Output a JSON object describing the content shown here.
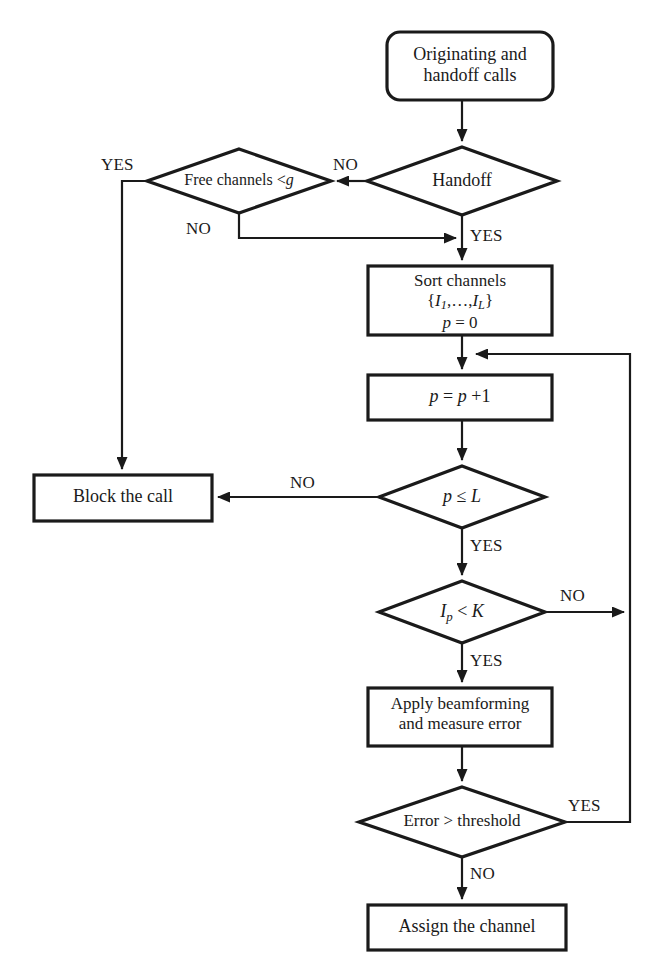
{
  "diagram": {
    "stroke_color": "#1a1a1a",
    "fill_color": "#ffffff",
    "nodes": [
      {
        "id": "start",
        "shape": "rounded-rect",
        "lines": [
          "Originating and",
          "handoff calls"
        ]
      },
      {
        "id": "handoff",
        "shape": "diamond",
        "lines": [
          "Handoff"
        ]
      },
      {
        "id": "freechan",
        "shape": "diamond",
        "lines": [
          "Free channels <g"
        ]
      },
      {
        "id": "sort",
        "shape": "rect",
        "lines": [
          "Sort channels",
          "{I1,…,IL}",
          "p = 0"
        ]
      },
      {
        "id": "increment",
        "shape": "rect",
        "lines": [
          "p = p +1"
        ]
      },
      {
        "id": "block",
        "shape": "rect",
        "lines": [
          "Block the call"
        ]
      },
      {
        "id": "ple",
        "shape": "diamond",
        "lines": [
          "p ≤ L"
        ]
      },
      {
        "id": "ipk",
        "shape": "diamond",
        "lines": [
          "Ip < K"
        ]
      },
      {
        "id": "beamform",
        "shape": "rect",
        "lines": [
          "Apply beamforming",
          "and measure error"
        ]
      },
      {
        "id": "errthresh",
        "shape": "diamond",
        "lines": [
          "Error > threshold"
        ]
      },
      {
        "id": "assign",
        "shape": "rect",
        "lines": [
          "Assign the channel"
        ]
      }
    ],
    "edge_labels": [
      {
        "id": "yes-freechan",
        "text": "YES"
      },
      {
        "id": "no-handoff",
        "text": "NO"
      },
      {
        "id": "no-freechan",
        "text": "NO"
      },
      {
        "id": "yes-handoff",
        "text": "YES"
      },
      {
        "id": "no-ple",
        "text": "NO"
      },
      {
        "id": "yes-ple",
        "text": "YES"
      },
      {
        "id": "no-ipk",
        "text": "NO"
      },
      {
        "id": "yes-ipk",
        "text": "YES"
      },
      {
        "id": "yes-errthresh",
        "text": "YES"
      },
      {
        "id": "no-errthresh",
        "text": "NO"
      }
    ]
  }
}
